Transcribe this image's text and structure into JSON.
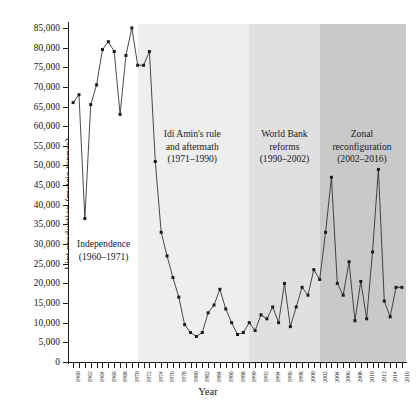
{
  "chart_data": {
    "type": "line",
    "title": "",
    "xlabel": "Year",
    "ylabel": "Lint production (metric tonnes)",
    "xlim": [
      1959.3,
      2016.7
    ],
    "ylim": [
      0,
      86000
    ],
    "grid": false,
    "legend": "none",
    "y_ticks": [
      0,
      5000,
      10000,
      15000,
      20000,
      25000,
      30000,
      35000,
      40000,
      45000,
      50000,
      55000,
      60000,
      65000,
      70000,
      75000,
      80000,
      85000
    ],
    "y_tick_labels": [
      "0",
      "5,000",
      "10,000",
      "15,000",
      "20,000",
      "25,000",
      "30,000",
      "35,000",
      "40,000",
      "45,000",
      "50,000",
      "55,000",
      "60,000",
      "65,000",
      "70,000",
      "75,000",
      "80,000",
      "85,000"
    ],
    "x_ticks": [
      1960,
      1961,
      1962,
      1963,
      1964,
      1965,
      1966,
      1967,
      1968,
      1969,
      1970,
      1971,
      1972,
      1973,
      1974,
      1975,
      1976,
      1977,
      1978,
      1979,
      1980,
      1981,
      1982,
      1983,
      1984,
      1985,
      1986,
      1987,
      1988,
      1989,
      1990,
      1991,
      1992,
      1993,
      1994,
      1995,
      1996,
      1997,
      1998,
      1999,
      2000,
      2001,
      2002,
      2003,
      2004,
      2005,
      2006,
      2007,
      2008,
      2009,
      2010,
      2011,
      2012,
      2013,
      2014,
      2015,
      2016
    ],
    "x_tick_labels": [
      "1960",
      "",
      "1962",
      "",
      "1964",
      "",
      "1966",
      "",
      "1968",
      "",
      "1970",
      "",
      "1972",
      "",
      "1974",
      "",
      "1976",
      "",
      "1978",
      "",
      "1980",
      "",
      "1982",
      "",
      "1984",
      "",
      "1986",
      "",
      "1988",
      "",
      "1990",
      "",
      "1992",
      "",
      "1994",
      "",
      "1996",
      "",
      "1998",
      "",
      "2000",
      "",
      "2002",
      "",
      "2004",
      "",
      "2006",
      "",
      "2008",
      "",
      "2010",
      "",
      "2012",
      "",
      "2014",
      "",
      "2016"
    ],
    "x": [
      1960,
      1961,
      1962,
      1963,
      1964,
      1965,
      1966,
      1967,
      1968,
      1969,
      1970,
      1971,
      1972,
      1973,
      1974,
      1975,
      1976,
      1977,
      1978,
      1979,
      1980,
      1981,
      1982,
      1983,
      1984,
      1985,
      1986,
      1987,
      1988,
      1989,
      1990,
      1991,
      1992,
      1993,
      1994,
      1995,
      1996,
      1997,
      1998,
      1999,
      2000,
      2001,
      2002,
      2003,
      2004,
      2005,
      2006,
      2007,
      2008,
      2009,
      2010,
      2011,
      2012,
      2013,
      2014,
      2015,
      2016
    ],
    "values": [
      66000,
      68000,
      36500,
      65500,
      70500,
      79500,
      81500,
      79000,
      63000,
      78000,
      85000,
      75500,
      75500,
      79000,
      51000,
      33000,
      27000,
      21500,
      16500,
      9500,
      7500,
      6500,
      7500,
      12500,
      14500,
      18500,
      13500,
      10000,
      7000,
      7500,
      10000,
      8000,
      12000,
      11000,
      14000,
      10000,
      20000,
      9000,
      14000,
      19000,
      17000,
      23500,
      21000,
      33000,
      47000,
      20000,
      17000,
      25500,
      10500,
      20500,
      11000,
      28000,
      49000,
      15500,
      11500,
      19000,
      19000
    ],
    "bands": [
      {
        "label": "Independence\n(1960–1971)",
        "x_start": 1959.3,
        "x_end": 1971.0,
        "color": "#ffffff",
        "label_x": 1965.2,
        "label_y": 31500
      },
      {
        "label": "Idi Amin's rule\nand aftermath\n(1971–1990)",
        "x_start": 1971.0,
        "x_end": 1990.0,
        "color": "#eeeeee",
        "label_x": 1980.3,
        "label_y": 59500
      },
      {
        "label": "World Bank\nreforms\n(1990–2002)",
        "x_start": 1990.0,
        "x_end": 2002.0,
        "color": "#e0e0e0",
        "label_x": 1996.0,
        "label_y": 59500
      },
      {
        "label": "Zonal\nreconfiguration\n(2002–2016)",
        "x_start": 2002.0,
        "x_end": 2016.7,
        "color": "#c9c9c9",
        "label_x": 2009.2,
        "label_y": 59500
      }
    ],
    "line_color": "#2a2a2a",
    "marker_color": "#1c1c1c"
  }
}
